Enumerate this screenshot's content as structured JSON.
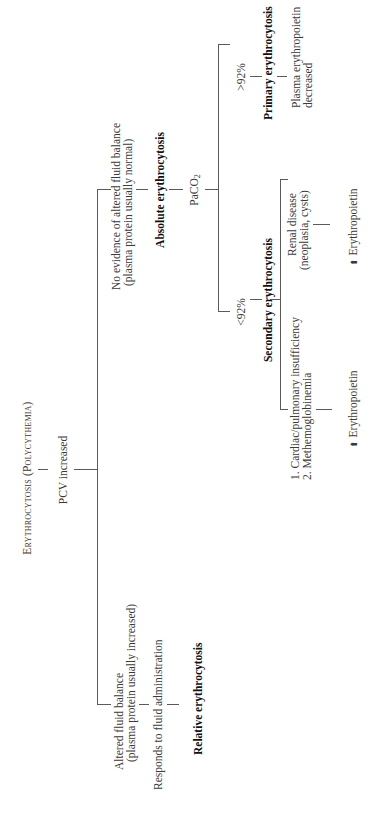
{
  "diagram": {
    "title": "Erythrocytosis (Polycythemia)",
    "root": "PCV increased",
    "relative_branch": {
      "condition_line1": "Altered fluid balance",
      "condition_line2": "(plasma protein usually increased)",
      "test": "Responds to fluid administration",
      "result": "Relative erythrocytosis"
    },
    "absolute_branch": {
      "condition_line1": "No evidence of altered fluid balance",
      "condition_line2": "(plasma protein usually normal)",
      "result": "Absolute erythrocytosis",
      "test_main": "PaCO",
      "test_sub": "2",
      "high_label": ">92%",
      "low_label": "<92%",
      "primary": {
        "result": "Primary erythrocytosis",
        "note_line1": "Plasma erythropoietin",
        "note_line2": "decreased"
      },
      "secondary": {
        "result": "Secondary erythrocytosis",
        "cause_a_line1": "1. Cardiac/pulmonary insufficiency",
        "cause_a_line2": "2. Methemoglobinemia",
        "cause_a_effect": "Erythropoietin",
        "cause_b_line1": "Renal disease",
        "cause_b_line2": "(neoplasia, cysts)",
        "cause_b_effect": "Erythropoietin",
        "arrow_symbol": "⬆"
      }
    },
    "colors": {
      "text": "#3a3a3a",
      "bold_text": "#111111",
      "lines": "#5a5a5a",
      "background": "#ffffff"
    }
  }
}
